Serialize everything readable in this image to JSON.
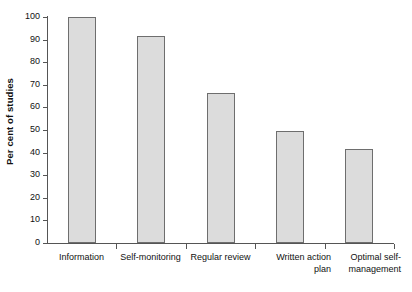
{
  "chart_data": {
    "type": "bar",
    "title": "",
    "subtitle": "",
    "xlabel": "",
    "ylabel": "Per cent of studies",
    "categories": [
      "Information",
      "Self-monitoring",
      "Regular review",
      "Written action\nplan",
      "Optimal self-\nmanagement"
    ],
    "values": [
      100,
      91.5,
      66.5,
      49.5,
      41.5
    ],
    "ylim": [
      0,
      100
    ],
    "ytick_values": [
      0,
      10,
      20,
      30,
      40,
      50,
      60,
      70,
      80,
      90,
      100
    ],
    "ytick_labels": [
      "0",
      "10",
      "20",
      "30",
      "40",
      "50",
      "60",
      "70",
      "80",
      "90",
      "100"
    ],
    "grid": false,
    "legend": null,
    "legend_position": "none",
    "bar_fill_color": "#dcdcdc",
    "bar_border_color": "#6e6e6e",
    "axis_color": "#555555",
    "background_color": "#ffffff"
  },
  "axes": {
    "y_title": "Per cent of studies"
  }
}
